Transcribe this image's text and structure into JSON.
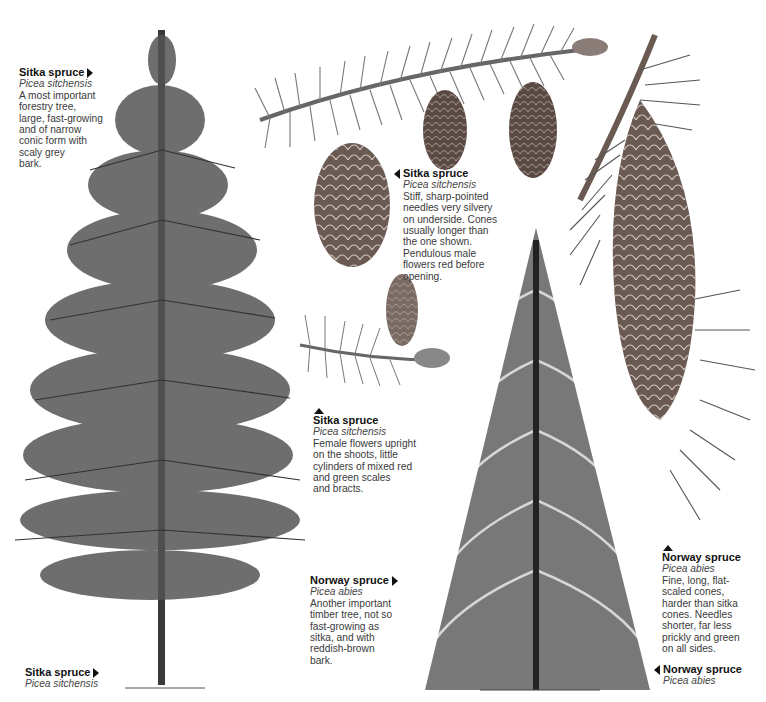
{
  "captions": {
    "sitka_tree_top": {
      "title": "Sitka spruce",
      "scientific": "Picea sitchensis",
      "description": "A most important\nforestry tree,\nlarge, fast-growing\nand of narrow\nconic form with\nscaly grey\nbark.",
      "pointer": "right"
    },
    "sitka_cones": {
      "title": "Sitka spruce",
      "scientific": "Picea sitchensis",
      "description": "Stiff, sharp-pointed\nneedles very silvery\non underside. Cones\nusually longer than\nthe one shown.\nPendulous male\nflowers red before\n            opening.",
      "pointer": "left"
    },
    "sitka_female_flowers": {
      "title": "Sitka spruce",
      "scientific": "Picea sitchensis",
      "description": "Female flowers upright\non the shoots, little\ncylinders of mixed red\nand green scales\nand bracts.",
      "pointer": "up"
    },
    "norway_tree": {
      "title": "Norway spruce",
      "scientific": "Picea abies",
      "description": "Another important\ntimber tree, not so\nfast-growing as\nsitka, and with\nreddish-brown\nbark.",
      "pointer": "right"
    },
    "norway_cone": {
      "title": "Norway spruce",
      "scientific": "Picea abies",
      "description": "Fine, long, flat-\nscaled cones,\nharder than sitka\ncones. Needles\nshorter, far less\nprickly and green\non all sides.",
      "pointer": "up"
    },
    "norway_tree_label": {
      "title": "Norway spruce",
      "scientific": "Picea abies",
      "pointer": "left"
    },
    "sitka_tree_label": {
      "title": "Sitka spruce",
      "scientific": "Picea sitchensis",
      "pointer": "right"
    }
  },
  "illustrations": [
    {
      "name": "sitka-spruce-tree",
      "subject": "Sitka spruce tree"
    },
    {
      "name": "sitka-spruce-branch-with-cones",
      "subject": "Sitka spruce branch with cones"
    },
    {
      "name": "sitka-spruce-female-flower-shoot",
      "subject": "Sitka spruce female flower shoot"
    },
    {
      "name": "norway-spruce-tree",
      "subject": "Norway spruce tree"
    },
    {
      "name": "norway-spruce-hanging-cone",
      "subject": "Norway spruce branch with hanging cone"
    }
  ],
  "colors": {
    "ink": "#111111",
    "text": "#3a3a3a",
    "foliage": "#4a4a4a",
    "cone": "#6a5a52",
    "background": "#ffffff"
  }
}
